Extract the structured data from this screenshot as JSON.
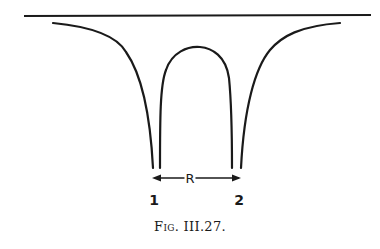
{
  "figure": {
    "caption": "Fig. III.27.",
    "labels": {
      "separation": "R",
      "left_point": "1",
      "right_point": "2"
    },
    "colors": {
      "ink": "#1a1a1a",
      "background": "#ffffff"
    }
  }
}
